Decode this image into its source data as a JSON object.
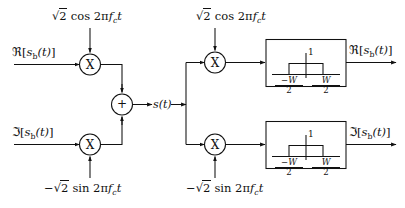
{
  "diagram": {
    "line_color": "#111111",
    "background": "#ffffff"
  },
  "modulator": {
    "inputs": [
      {
        "id": "real-in",
        "label_parts": {
          "operator": "ℜ",
          "open": "[",
          "base": "s",
          "sub": "b",
          "arg": "(t)",
          "close": "]"
        }
      },
      {
        "id": "imag-in",
        "label_parts": {
          "operator": "ℑ",
          "open": "[",
          "base": "s",
          "sub": "b",
          "arg": "(t)",
          "close": "]"
        }
      }
    ],
    "carriers": [
      {
        "id": "cos-carrier-tx",
        "sign": "",
        "radical": "2",
        "trig": "cos",
        "arg": "2π",
        "freq": "f",
        "freq_sub": "c",
        "var": "t"
      },
      {
        "id": "sin-carrier-tx",
        "sign": "−",
        "radical": "2",
        "trig": "sin",
        "arg": "2π",
        "freq": "f",
        "freq_sub": "c",
        "var": "t"
      }
    ],
    "multiplier_glyph": "X",
    "summer_glyph": "+",
    "output": {
      "id": "passband-signal",
      "base": "s",
      "arg": "(t)"
    }
  },
  "demodulator": {
    "carriers": [
      {
        "id": "cos-carrier-rx",
        "sign": "",
        "radical": "2",
        "trig": "cos",
        "arg": "2π",
        "freq": "f",
        "freq_sub": "c",
        "var": "t"
      },
      {
        "id": "sin-carrier-rx",
        "sign": "−",
        "radical": "2",
        "trig": "sin",
        "arg": "2π",
        "freq": "f",
        "freq_sub": "c",
        "var": "t"
      }
    ],
    "multiplier_glyph": "X",
    "filters": [
      {
        "id": "lowpass-filter-i",
        "gain_label": "1",
        "left_edge": {
          "num": "−W",
          "den": "2"
        },
        "right_edge": {
          "num": "W",
          "den": "2"
        }
      },
      {
        "id": "lowpass-filter-q",
        "gain_label": "1",
        "left_edge": {
          "num": "−W",
          "den": "2"
        },
        "right_edge": {
          "num": "W",
          "den": "2"
        }
      }
    ],
    "outputs": [
      {
        "id": "real-out",
        "label_parts": {
          "operator": "ℜ",
          "open": "[",
          "base": "s",
          "sub": "b",
          "arg": "(t)",
          "close": "]"
        }
      },
      {
        "id": "imag-out",
        "label_parts": {
          "operator": "ℑ",
          "open": "[",
          "base": "s",
          "sub": "b",
          "arg": "(t)",
          "close": "]"
        }
      }
    ]
  }
}
